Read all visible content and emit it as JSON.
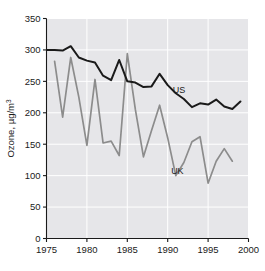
{
  "chart_data": {
    "type": "line",
    "title": "",
    "xlabel": "",
    "ylabel": "Ozone, µg/m",
    "ylabel_exponent": "3",
    "xlim": [
      1975,
      2000
    ],
    "ylim": [
      0,
      350
    ],
    "xticks": [
      1975,
      1980,
      1985,
      1990,
      1995,
      2000
    ],
    "yticks": [
      0,
      50,
      100,
      150,
      200,
      250,
      300,
      350
    ],
    "grid": true,
    "grid_color": "#ffffff",
    "plot_background": "#e6e6e9",
    "legend_position": "inline-annotation",
    "series": [
      {
        "name": "US",
        "color": "#1a1a1a",
        "label_x": 1991.4,
        "label_y": 232,
        "x": [
          1975,
          1976,
          1977,
          1978,
          1979,
          1980,
          1981,
          1982,
          1983,
          1984,
          1985,
          1986,
          1987,
          1988,
          1989,
          1990,
          1991,
          1992,
          1993,
          1994,
          1995,
          1996,
          1997,
          1998,
          1999
        ],
        "values": [
          300,
          300,
          299,
          306,
          288,
          283,
          280,
          259,
          252,
          284,
          250,
          248,
          241,
          242,
          262,
          244,
          231,
          222,
          209,
          215,
          213,
          221,
          210,
          206,
          218
        ]
      },
      {
        "name": "UK",
        "color": "#8c8c8c",
        "label_x": 1991.2,
        "label_y": 103,
        "x": [
          1976,
          1977,
          1978,
          1979,
          1980,
          1981,
          1982,
          1983,
          1984,
          1985,
          1986,
          1987,
          1988,
          1989,
          1990,
          1991,
          1992,
          1993,
          1994,
          1995,
          1996,
          1997,
          1998
        ],
        "values": [
          282,
          193,
          288,
          225,
          148,
          253,
          152,
          155,
          132,
          294,
          205,
          130,
          172,
          212,
          160,
          100,
          121,
          154,
          162,
          88,
          123,
          143,
          123
        ]
      }
    ]
  },
  "annotations": {
    "us_label": "US",
    "uk_label": "UK"
  }
}
